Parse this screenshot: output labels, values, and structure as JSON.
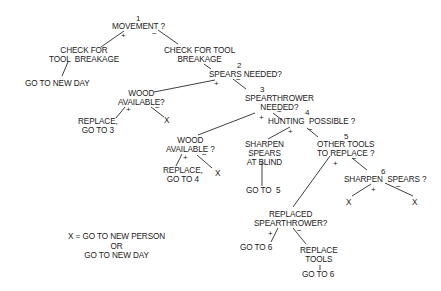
{
  "diagram": {
    "type": "decision-tree",
    "nodes": {
      "n1_num": "1",
      "n1": "MOVEMENT ?",
      "check_left": "CHECK FOR\nTOOL  BREAKAGE",
      "go_new_day": "GO TO NEW DAY",
      "check_right": "CHECK FOR TOOL\nBREAKAGE",
      "n2_num": "2",
      "n2": "SPEARS NEEDED?",
      "wood1": "WOOD\nAVAILABLE?",
      "replace3": "REPLACE,\nGO TO 3",
      "x1": "X",
      "n3_num": "3",
      "n3": "SPEARTHROWER\nNEEDED?",
      "wood2": "WOOD\nAVAILABLE ?",
      "replace4": "REPLACE,\nGO TO 4",
      "x2": "X",
      "n4_num": "4",
      "n4": "HUNTING  POSSIBLE ?",
      "sharpen_blind": "SHARPEN\nSPEARS\nAT BLIND",
      "goto5": "GO TO  5",
      "n5_num": "5",
      "n5": "OTHER TOOLS\nTO REPLACE ?",
      "n6_num": "6",
      "n6": "SHARPEN  SPEARS ?",
      "x3": "X",
      "x4": "X",
      "replaced_st": "REPLACED\nSPEARTHROWER?",
      "goto6a": "GO TO 6",
      "replace_tools": "REPLACE\nTOOLS",
      "goto6b": "GO TO 6"
    },
    "signs": {
      "plus": "+",
      "minus": "−"
    },
    "legend": "X = GO TO NEW PERSON\nOR\nGO TO NEW DAY"
  }
}
